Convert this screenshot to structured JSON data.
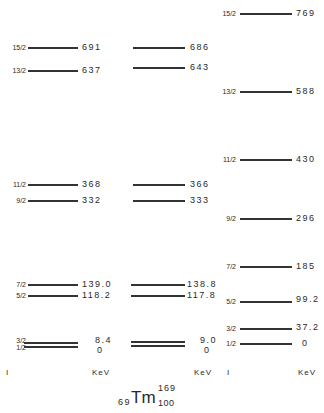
{
  "diagram": {
    "type": "nuclear energy level diagram",
    "nuclide": {
      "Z": "69",
      "symbol": "Tm",
      "A": "169",
      "N": "100"
    },
    "columns": [
      {
        "name": "experimental",
        "levels": [
          {
            "spin": "15/2",
            "energy": "691"
          },
          {
            "spin": "13/2",
            "energy": "637"
          },
          {
            "spin": "11/2",
            "energy": "368"
          },
          {
            "spin": "9/2",
            "energy": "332"
          },
          {
            "spin": "7/2",
            "energy": "139.0"
          },
          {
            "spin": "5/2",
            "energy": "118.2"
          },
          {
            "spin": "3/2",
            "energy": "8.4"
          },
          {
            "spin": "1/2",
            "energy": "0"
          }
        ],
        "footer_spin": "I",
        "footer_energy": "KeV"
      },
      {
        "name": "calculated-1",
        "levels": [
          {
            "energy": "686"
          },
          {
            "energy": "643"
          },
          {
            "energy": "366"
          },
          {
            "energy": "333"
          },
          {
            "energy": "138.8"
          },
          {
            "energy": "117.8"
          },
          {
            "energy": "9.0"
          },
          {
            "energy": "0"
          }
        ],
        "footer_energy": "KeV"
      },
      {
        "name": "calculated-2",
        "levels": [
          {
            "spin": "15/2",
            "energy": "769"
          },
          {
            "spin": "13/2",
            "energy": "588"
          },
          {
            "spin": "11/2",
            "energy": "430"
          },
          {
            "spin": "9/2",
            "energy": "296"
          },
          {
            "spin": "7/2",
            "energy": "185"
          },
          {
            "spin": "5/2",
            "energy": "99.2"
          },
          {
            "spin": "3/2",
            "energy": "37.2"
          },
          {
            "spin": "1/2",
            "energy": "0"
          }
        ],
        "footer_spin": "I",
        "footer_energy": "KeV"
      }
    ]
  }
}
